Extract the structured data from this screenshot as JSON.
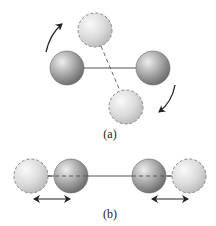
{
  "diagram": {
    "colors": {
      "solid_ball_light": "#e6e6e6",
      "solid_ball_dark": "#7a7a7a",
      "ghost_ball_light": "#f6f6f6",
      "ghost_ball_dark": "#c4c4c4",
      "bond": "#555555",
      "dashed_outline": "#8a8a8a",
      "arrow": "#222222"
    },
    "panel_a": {
      "label": "(a)",
      "motion": "rotation",
      "solid_atoms": [
        {
          "cx": 67,
          "cy": 68,
          "r": 17
        },
        {
          "cx": 153,
          "cy": 68,
          "r": 17
        }
      ],
      "ghost_atoms": [
        {
          "cx": 95,
          "cy": 30,
          "r": 17
        },
        {
          "cx": 126,
          "cy": 107,
          "r": 17
        }
      ],
      "arrows": [
        "curved-arrow-counterclockwise-top-left",
        "curved-arrow-clockwise-bottom-right"
      ]
    },
    "panel_b": {
      "label": "(b)",
      "motion": "vibration",
      "solid_atoms": [
        {
          "cx": 71,
          "cy": 176,
          "r": 17
        },
        {
          "cx": 149,
          "cy": 176,
          "r": 17
        }
      ],
      "ghost_atoms": [
        {
          "cx": 31,
          "cy": 176,
          "r": 17
        },
        {
          "cx": 189,
          "cy": 176,
          "r": 17
        }
      ],
      "arrows": [
        "double-arrow-left",
        "double-arrow-right"
      ]
    }
  }
}
